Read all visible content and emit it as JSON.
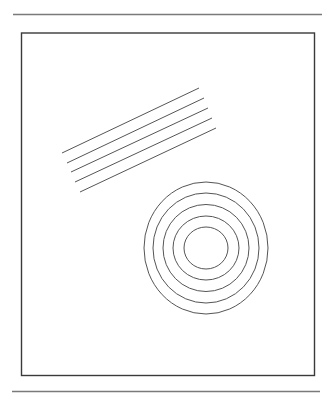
{
  "colors": {
    "background": "#ffffff",
    "rule": "#7a7a7a",
    "frame": "#3a3a3a",
    "stroke": "#555555"
  },
  "rules": [
    {
      "name": "top-rule",
      "x1": 13,
      "y1": 14.5,
      "x2": 322,
      "y2": 14.5
    },
    {
      "name": "bottom-rule",
      "x1": 12,
      "y1": 391.5,
      "x2": 320,
      "y2": 391.5
    }
  ],
  "frame": {
    "x": 21.5,
    "y": 33,
    "width": 293,
    "height": 342.5
  },
  "parallel_lines": [
    {
      "x1": 62,
      "y1": 153,
      "x2": 199,
      "y2": 88
    },
    {
      "x1": 67,
      "y1": 163,
      "x2": 204,
      "y2": 98
    },
    {
      "x1": 71,
      "y1": 172,
      "x2": 208,
      "y2": 108
    },
    {
      "x1": 75,
      "y1": 182,
      "x2": 212,
      "y2": 118
    },
    {
      "x1": 80,
      "y1": 192,
      "x2": 216,
      "y2": 128
    }
  ],
  "concentric_circles": {
    "cx": 206,
    "cy": 248,
    "radii": [
      {
        "rx": 62,
        "ry": 66
      },
      {
        "rx": 53,
        "ry": 55
      },
      {
        "rx": 43,
        "ry": 43.5
      },
      {
        "rx": 33,
        "ry": 32
      },
      {
        "rx": 22,
        "ry": 21
      }
    ]
  }
}
